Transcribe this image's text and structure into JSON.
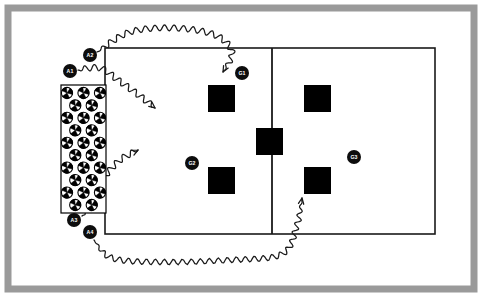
{
  "diagram": {
    "type": "court-drill",
    "colors": {
      "frame": "#9a9a9a",
      "court_line": "#1a1a1a",
      "target_square": "#000000",
      "player_marker": "#0d0d0d",
      "player_label_text": "#ffffff",
      "ball_outline": "#000000",
      "background": "#ffffff",
      "path_stroke": "#1a1a1a"
    },
    "frame": {
      "name": "outer-border",
      "x": 8,
      "y": 8,
      "width": 466,
      "height": 281,
      "stroke_width": 7
    },
    "court": {
      "name": "court-outline",
      "x": 105,
      "y": 48,
      "width": 330,
      "height": 186,
      "stroke_width": 1.6,
      "net_line": {
        "name": "center-net-line",
        "x": 272,
        "y1": 48,
        "y2": 234,
        "stroke_width": 1.8
      }
    },
    "ball_rack": {
      "name": "ball-rack",
      "label": "Ball Cart",
      "x": 61,
      "y": 85,
      "width": 45,
      "height": 128,
      "stroke_width": 1.2,
      "ball_radius": 5.6,
      "ball_count": 30,
      "columns": 3,
      "rows": 10
    },
    "targets": [
      {
        "name": "target-square-top-left",
        "id": "T1",
        "x": 208,
        "y": 85,
        "size": 27
      },
      {
        "name": "target-square-top-right",
        "id": "T2",
        "x": 304,
        "y": 85,
        "size": 27
      },
      {
        "name": "target-square-center-net",
        "id": "T3",
        "x": 256,
        "y": 128,
        "size": 27
      },
      {
        "name": "target-square-bottom-left",
        "id": "T4",
        "x": 208,
        "y": 167,
        "size": 27
      },
      {
        "name": "target-square-bottom-right",
        "id": "T5",
        "x": 304,
        "y": 167,
        "size": 27
      }
    ],
    "players": [
      {
        "name": "player-marker-a1",
        "label": "A1",
        "cx": 70,
        "cy": 71,
        "r": 7.0,
        "role": "attacker"
      },
      {
        "name": "player-marker-a2",
        "label": "A2",
        "cx": 90,
        "cy": 55,
        "r": 7.0,
        "role": "attacker"
      },
      {
        "name": "player-marker-a3",
        "label": "A3",
        "cx": 74,
        "cy": 220,
        "r": 7.0,
        "role": "attacker"
      },
      {
        "name": "player-marker-a4",
        "label": "A4",
        "cx": 90,
        "cy": 232,
        "r": 7.0,
        "role": "attacker"
      },
      {
        "name": "player-marker-g1",
        "label": "G1",
        "cx": 242,
        "cy": 73,
        "r": 7.0,
        "role": "target-player"
      },
      {
        "name": "player-marker-g2",
        "label": "G2",
        "cx": 192,
        "cy": 163,
        "r": 7.0,
        "role": "target-player"
      },
      {
        "name": "player-marker-g3",
        "label": "G3",
        "cx": 354,
        "cy": 157,
        "r": 7.0,
        "role": "target-player"
      }
    ],
    "paths": [
      {
        "name": "path-a2-to-top-left-target",
        "from": "A2",
        "to": "T1",
        "style": "wavy-arrow",
        "description": "A2 arcs over the top of the court down to the top-left target square"
      },
      {
        "name": "path-a1-into-left-court",
        "from": "A1",
        "to": "left-court-interior",
        "style": "wavy-arrow",
        "description": "A1 travels diagonally into the left court interior"
      },
      {
        "name": "path-a3-into-left-court",
        "from": "A3",
        "to": "left-court-interior",
        "style": "wavy-arrow",
        "description": "A3 rises diagonally up into the left court interior"
      },
      {
        "name": "path-a4-to-bottom-right-target",
        "from": "A4",
        "to": "T5",
        "style": "wavy-arrow",
        "description": "A4 runs along the bottom of the court up to the bottom-right target square"
      }
    ]
  }
}
